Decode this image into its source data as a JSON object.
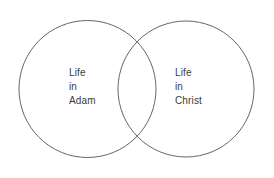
{
  "diagram": {
    "type": "venn",
    "title": "",
    "background_color": "#ffffff",
    "stroke_color": "#666666",
    "text_color": "#3b3b3b",
    "sets": [
      {
        "id": "life-in-adam",
        "label_lines": [
          "Life",
          "in",
          "Adam"
        ],
        "line_1": "Life",
        "line_2": "in",
        "line_3": "Adam",
        "center_x": 87.5,
        "center_y": 89,
        "radius": 68.5
      },
      {
        "id": "life-in-christ",
        "label_lines": [
          "Life",
          "in",
          "Christ"
        ],
        "line_1": "Life",
        "line_2": "in",
        "line_3": "Christ",
        "center_x": 186,
        "center_y": 89,
        "radius": 68
      }
    ],
    "intersection": {
      "label": "",
      "top_point": {
        "x": 137,
        "y": 35
      },
      "bottom_point": {
        "x": 137,
        "y": 143
      }
    }
  }
}
